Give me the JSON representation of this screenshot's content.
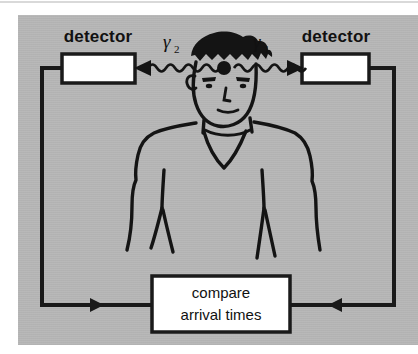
{
  "diagram": {
    "background_color": "#b8b8b8",
    "page_color": "#ffffff",
    "ink_color": "#141414",
    "box_fill": "#ffffff"
  },
  "detectors": {
    "left": {
      "label": "detector"
    },
    "right": {
      "label": "detector"
    }
  },
  "gamma_rays": {
    "left": {
      "symbol": "γ",
      "subscript": "2",
      "direction": "left"
    },
    "right": {
      "symbol": "γ",
      "subscript": "1",
      "direction": "right"
    }
  },
  "annihilation_point": {
    "name": "annihilation-event-dot"
  },
  "subject": {
    "name": "patient-figure"
  },
  "compare_box": {
    "line1": "compare",
    "line2": "arrival times"
  },
  "signal_flow": {
    "left_arrow_direction": "right",
    "right_arrow_direction": "left"
  }
}
